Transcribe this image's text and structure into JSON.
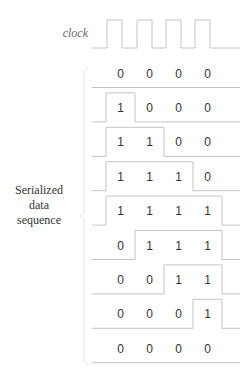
{
  "clock": {
    "label": "clock",
    "pulses": 4
  },
  "sequence_label": {
    "lines": [
      "Serialized",
      "data",
      "sequence"
    ]
  },
  "colors": {
    "line": "#c4c4c4",
    "text": "#333333",
    "brace": "#e6e6e6"
  },
  "rows": [
    {
      "bits": [
        0,
        0,
        0,
        0
      ]
    },
    {
      "bits": [
        1,
        0,
        0,
        0
      ]
    },
    {
      "bits": [
        1,
        1,
        0,
        0
      ]
    },
    {
      "bits": [
        1,
        1,
        1,
        0
      ]
    },
    {
      "bits": [
        1,
        1,
        1,
        1
      ]
    },
    {
      "bits": [
        0,
        1,
        1,
        1
      ]
    },
    {
      "bits": [
        0,
        0,
        1,
        1
      ]
    },
    {
      "bits": [
        0,
        0,
        0,
        1
      ]
    },
    {
      "bits": [
        0,
        0,
        0,
        0
      ]
    }
  ]
}
